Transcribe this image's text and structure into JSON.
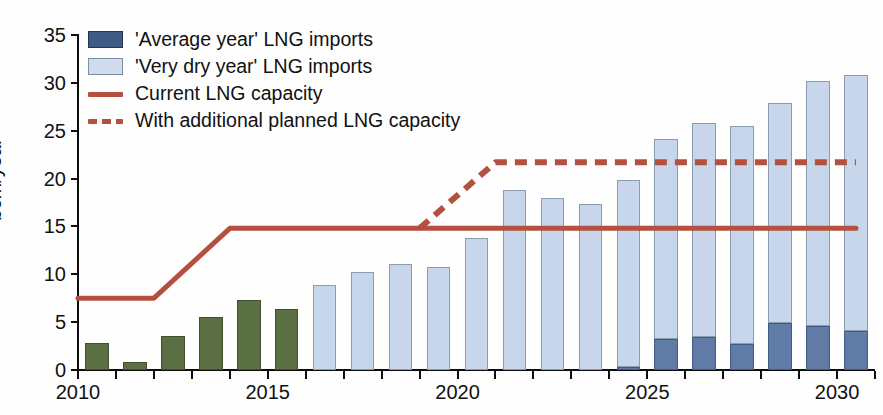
{
  "chart_data": {
    "type": "bar",
    "title": "",
    "subtitle": "",
    "xlabel": "",
    "ylabel": "bcm/year",
    "ylim": [
      0,
      35
    ],
    "xlim": [
      2010,
      2030
    ],
    "grid": false,
    "stacked": true,
    "legend_position": "top-left",
    "y_ticks": [
      0,
      5,
      10,
      15,
      20,
      25,
      30,
      35
    ],
    "y_tick_labels": [
      "0",
      "5",
      "10",
      "15",
      "20",
      "25",
      "30",
      "35"
    ],
    "x_tick_labels": [
      "2010",
      "2015",
      "2020",
      "2025",
      "2030"
    ],
    "x_tick_years": [
      2010,
      2015,
      2020,
      2025,
      2030
    ],
    "categories": [
      2010,
      2011,
      2012,
      2013,
      2014,
      2015,
      2016,
      2017,
      2018,
      2019,
      2020,
      2021,
      2022,
      2023,
      2024,
      2025,
      2026,
      2027,
      2028,
      2029,
      2030
    ],
    "series": [
      {
        "name": "Historical LNG imports",
        "color": "#5a7043",
        "values": [
          2.8,
          0.8,
          3.6,
          5.5,
          7.3,
          6.4,
          null,
          null,
          null,
          null,
          null,
          null,
          null,
          null,
          null,
          null,
          null,
          null,
          null,
          null,
          null
        ]
      },
      {
        "name": "'Average year' LNG imports",
        "color": "#5f7ba6",
        "values": [
          null,
          null,
          null,
          null,
          null,
          null,
          0,
          0,
          0,
          0,
          0,
          0,
          0,
          0,
          0.3,
          3.2,
          3.5,
          2.7,
          4.9,
          4.6,
          4.1
        ]
      },
      {
        "name": "'Very dry year' LNG imports",
        "color": "#c7d6ea",
        "values": [
          null,
          null,
          null,
          null,
          null,
          null,
          8.9,
          10.2,
          11.1,
          10.8,
          13.8,
          18.8,
          18.0,
          17.3,
          19.9,
          24.1,
          25.8,
          25.5,
          27.9,
          30.2,
          30.8
        ]
      }
    ],
    "lines": [
      {
        "name": "Current LNG capacity",
        "color": "#b4503f",
        "style": "solid",
        "points": [
          [
            2010,
            7.5
          ],
          [
            2012,
            7.5
          ],
          [
            2014,
            14.8
          ],
          [
            2030.5,
            14.8
          ]
        ]
      },
      {
        "name": "With additional planned LNG capacity",
        "color": "#b4503f",
        "style": "dashed",
        "points": [
          [
            2019,
            14.8
          ],
          [
            2021,
            21.7
          ],
          [
            2030.5,
            21.7
          ]
        ]
      }
    ],
    "legend": [
      {
        "label": "'Average year' LNG imports",
        "type": "swatch",
        "color": "#3f5a85"
      },
      {
        "label": "'Very dry year' LNG imports",
        "type": "swatch",
        "color": "#cfdcee"
      },
      {
        "label": "Current LNG capacity",
        "type": "line",
        "color": "#b4503f"
      },
      {
        "label": "With additional planned LNG capacity",
        "type": "dashed-line",
        "color": "#b4503f"
      }
    ]
  }
}
